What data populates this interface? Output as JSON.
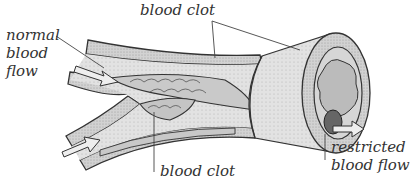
{
  "diagram": {
    "type": "anatomical illustration",
    "labels": {
      "normal_flow_line1": "normal",
      "normal_flow_line2": "blood",
      "normal_flow_line3": "flow",
      "clot_top": "blood clot",
      "clot_bottom": "blood clot",
      "restricted_line1": "restricted",
      "restricted_line2": "blood flow"
    },
    "colors": {
      "vessel_wall": "#bdbdbd",
      "vessel_inner": "#d9d9d9",
      "clot": "#c8c8c8",
      "outline": "#333333",
      "arrow_fill": "#e0e0e0"
    }
  }
}
